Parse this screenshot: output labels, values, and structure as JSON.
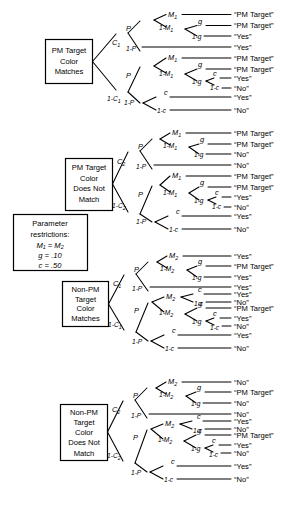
{
  "figure": {
    "type": "multinomial-processing-tree"
  },
  "param_box": {
    "line1": "Parameter",
    "line2": "restrictions:",
    "line3": "M₁ = M₂",
    "line3_base": "M",
    "line3_sub_a": "1",
    "line3_mid": " = M",
    "line3_sub_b": "2",
    "line4": "g = .10",
    "line4_sym": "g",
    "line4_val": " = .10",
    "line5": "c = .50",
    "line5_sym": "c",
    "line5_val": " = .50"
  },
  "trees": [
    {
      "id": "tree1",
      "box_lines": [
        "PM Target",
        "Color",
        "Matches"
      ],
      "root_branches": [
        {
          "label_base": "C",
          "label_sub": "1",
          "label_prefix": ""
        },
        {
          "label_base": "C",
          "label_sub": "1",
          "label_prefix": "1-"
        }
      ],
      "labels": {
        "P": "P",
        "notP": "1-P",
        "M_base": "M",
        "M_sub": "1",
        "notM_base": "1-M",
        "notM_sub": "1",
        "g": "g",
        "notg": "1-g",
        "c": "c",
        "notc": "1-c"
      },
      "outcomes": [
        "“PM Target”",
        "“PM Target”",
        "“Yes”",
        "“Yes”",
        "“PM Target”",
        "“PM Target”",
        "“Yes”",
        "“No”",
        "“Yes”",
        "“No”"
      ]
    },
    {
      "id": "tree2",
      "box_lines": [
        "PM Target",
        "Color",
        "Does Not",
        "Match"
      ],
      "root_branches": [
        {
          "label_base": "C",
          "label_sub": "2",
          "label_prefix": ""
        },
        {
          "label_base": "C",
          "label_sub": "2",
          "label_prefix": "1-"
        }
      ],
      "labels": {
        "P": "P",
        "notP": "1-P",
        "M_base": "M",
        "M_sub": "1",
        "notM_base": "1-M",
        "notM_sub": "1",
        "g": "g",
        "notg": "1-g",
        "c": "c",
        "notc": "1-c"
      },
      "outcomes": [
        "“PM Target”",
        "“PM Target”",
        "“No”",
        "“No”",
        "“PM Target”",
        "“PM Target”",
        "“Yes”",
        "“No”",
        "“Yes”",
        "“No”"
      ]
    },
    {
      "id": "tree3",
      "box_lines": [
        "Non-PM",
        "Target",
        "Color",
        "Matches"
      ],
      "root_branches": [
        {
          "label_base": "C",
          "label_sub": "1",
          "label_prefix": ""
        },
        {
          "label_base": "C",
          "label_sub": "1",
          "label_prefix": "1-"
        }
      ],
      "labels": {
        "P": "P",
        "notP": "1-P",
        "M_base": "M",
        "M_sub": "2",
        "notM_base": "1-M",
        "notM_sub": "2",
        "g": "g",
        "notg": "1-g",
        "c": "c",
        "notc": "1-c"
      },
      "outcomes": [
        "“Yes”",
        "“PM Target”",
        "“Yes”",
        "“Yes”",
        "“Yes”",
        "“No”",
        "“PM Target”",
        "“Yes”",
        "“No”",
        "“Yes”",
        "“No”"
      ]
    },
    {
      "id": "tree4",
      "box_lines": [
        "Non-PM",
        "Target",
        "Color",
        "Does Not",
        "Match"
      ],
      "root_branches": [
        {
          "label_base": "C",
          "label_sub": "2",
          "label_prefix": ""
        },
        {
          "label_base": "C",
          "label_sub": "2",
          "label_prefix": "1-"
        }
      ],
      "labels": {
        "P": "P",
        "notP": "1-P",
        "M_base": "M",
        "M_sub": "2",
        "notM_base": "1-M",
        "notM_sub": "2",
        "g": "g",
        "notg": "1-g",
        "c": "c",
        "notc": "1-c"
      },
      "outcomes": [
        "“No”",
        "“PM Target”",
        "“No”",
        "“No”",
        "“Yes”",
        "“No”",
        "“PM Target”",
        "“Yes”",
        "“No”",
        "“Yes”",
        "“No”"
      ]
    }
  ]
}
